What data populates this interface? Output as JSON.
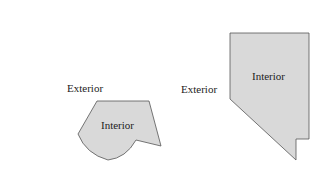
{
  "figure": {
    "left_region": {
      "exterior_label": "Exterior",
      "interior_label": "Interior",
      "fill_color": "#d9d9d9",
      "stroke_color": "#555555"
    },
    "right_region": {
      "exterior_label": "Exterior",
      "interior_label": "Interior",
      "fill_color": "#d9d9d9",
      "stroke_color": "#555555"
    }
  }
}
